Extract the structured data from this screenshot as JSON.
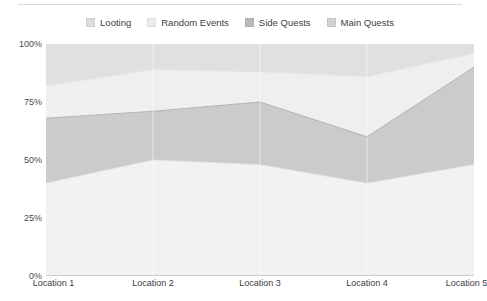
{
  "chart_data": {
    "type": "area",
    "stacked": true,
    "title": "",
    "subtitle": "",
    "xlabel": "",
    "ylabel": "",
    "categories": [
      "Location 1",
      "Location 2",
      "Location 3",
      "Location 4",
      "Location 5"
    ],
    "ylim": [
      0,
      100
    ],
    "y_ticks": [
      0,
      25,
      50,
      75,
      100
    ],
    "y_tick_labels": [
      "0%",
      "25%",
      "50%",
      "75%",
      "100%"
    ],
    "grid": true,
    "grid_axis": "y",
    "legend_position": "top-center",
    "series": [
      {
        "name": "Looting",
        "color": "#e0e0e0",
        "values": [
          18,
          11,
          12,
          14,
          4
        ],
        "cumulative_top": [
          100,
          100,
          100,
          100,
          100
        ]
      },
      {
        "name": "Random Events",
        "color": "#efefef",
        "values": [
          14,
          18,
          13,
          26,
          6
        ],
        "cumulative_top": [
          82,
          89,
          88,
          86,
          96
        ]
      },
      {
        "name": "Side Quests",
        "color": "#cbcbcb",
        "values": [
          28,
          21,
          27,
          20,
          42
        ],
        "cumulative_top": [
          68,
          71,
          75,
          60,
          90
        ]
      },
      {
        "name": "Main Quests",
        "color": "#f2f2f2",
        "values": [
          40,
          50,
          48,
          40,
          48
        ],
        "cumulative_top": [
          40,
          50,
          48,
          40,
          48
        ]
      }
    ]
  },
  "legend": {
    "items": [
      {
        "label": "Looting",
        "color": "#dcdcdc"
      },
      {
        "label": "Random Events",
        "color": "#ececec"
      },
      {
        "label": "Side Quests",
        "color": "#b9b9b9"
      },
      {
        "label": "Main Quests",
        "color": "#d2d2d2"
      }
    ]
  },
  "axes": {
    "y": {
      "labels": [
        "100%",
        "75%",
        "50%",
        "25%",
        "0%"
      ]
    },
    "x": {
      "labels": [
        "Location 1",
        "Location 2",
        "Location 3",
        "Location 4",
        "Location 5"
      ]
    }
  },
  "colors": {
    "grid": "#e9e9e9",
    "axis_text": "#3d3d3d",
    "plot_background": "#fbfbfb",
    "top_rule": "#d8d8d8"
  }
}
